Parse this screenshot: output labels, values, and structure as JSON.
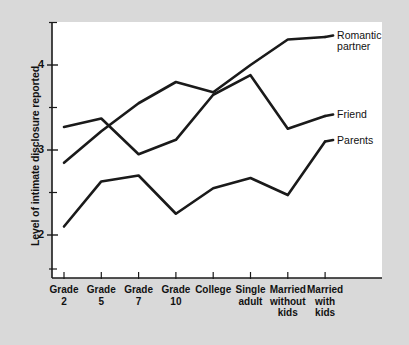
{
  "chart_data": {
    "type": "line",
    "title": "",
    "xlabel": "",
    "ylabel": "Level of intimate disclosure reported",
    "categories": [
      "Grade\n2",
      "Grade\n5",
      "Grade\n7",
      "Grade\n10",
      "College",
      "Single\nadult",
      "Married\nwithout\nkids",
      "Married\nwith\nkids"
    ],
    "ylim": [
      1.55,
      4.62
    ],
    "yticks": [
      2,
      3,
      4
    ],
    "ytick_labels": [
      "2",
      "3",
      "4"
    ],
    "y_minor_ticks": [
      1.6,
      2.5,
      3.5,
      4.5
    ],
    "grid": false,
    "legend": "inline-right-end-labels",
    "series": [
      {
        "name": "Romantic\npartner",
        "label": "Romantic\npartner",
        "color": "#1a1a1a",
        "values": [
          2.85,
          3.22,
          3.55,
          3.8,
          3.68,
          4.0,
          4.3,
          4.33
        ]
      },
      {
        "name": "Friend",
        "label": "Friend",
        "color": "#1a1a1a",
        "values": [
          3.27,
          3.37,
          2.95,
          3.12,
          3.65,
          3.88,
          3.25,
          3.4
        ]
      },
      {
        "name": "Parents",
        "label": "Parents",
        "color": "#1a1a1a",
        "values": [
          2.1,
          2.63,
          2.7,
          2.25,
          2.55,
          2.67,
          2.47,
          3.1
        ]
      }
    ]
  },
  "figure": {
    "background_color": "#d9d9d9",
    "plot_background_color": "#ffffff",
    "axis_color": "#1a1a1a"
  }
}
